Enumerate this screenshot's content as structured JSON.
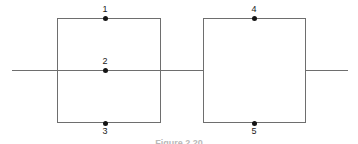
{
  "figure": {
    "caption": "Figure 2.20",
    "stroke_color": "#6e6e6e",
    "dot_color": "#141414",
    "background_color": "#ffffff",
    "label_color": "#1a1a1a"
  },
  "shapes": {
    "left_square": {
      "name": "left square",
      "x": 57,
      "y": 18,
      "width": 104,
      "height": 105
    },
    "right_square": {
      "name": "right square",
      "x": 203,
      "y": 18,
      "width": 103,
      "height": 105
    }
  },
  "axis_line": {
    "name": "horizontal line",
    "y": 70,
    "start_x": 12,
    "end_x": 348,
    "segments": [
      {
        "start_x": 12,
        "end_x": 204
      },
      {
        "start_x": 305,
        "end_x": 348
      }
    ]
  },
  "nodes": [
    {
      "id": "1",
      "label": "1",
      "x": 105,
      "y": 18,
      "position": "top edge of left square",
      "label_side": "above"
    },
    {
      "id": "2",
      "label": "2",
      "x": 105,
      "y": 70,
      "position": "center of left square on line",
      "label_side": "above"
    },
    {
      "id": "3",
      "label": "3",
      "x": 105,
      "y": 123,
      "position": "bottom edge of left square",
      "label_side": "below"
    },
    {
      "id": "4",
      "label": "4",
      "x": 254,
      "y": 18,
      "position": "top edge of right square",
      "label_side": "above"
    },
    {
      "id": "5",
      "label": "5",
      "x": 254,
      "y": 123,
      "position": "bottom edge of right square",
      "label_side": "below"
    }
  ]
}
